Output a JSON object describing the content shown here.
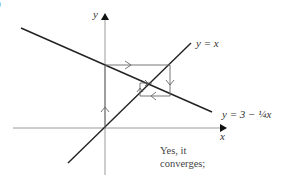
{
  "figure": {
    "part_label": ")",
    "axes": {
      "x_label": "x",
      "y_label": "y"
    },
    "lines": [
      {
        "name": "identity",
        "label": "y = x"
      },
      {
        "name": "map",
        "label": "y = 3 − ¼x"
      }
    ],
    "annotation": {
      "line1": "Yes, it",
      "line2": "converges;"
    },
    "colors": {
      "axis": "#9a9a9a",
      "curve": "#222222",
      "cobweb": "#555555"
    }
  }
}
